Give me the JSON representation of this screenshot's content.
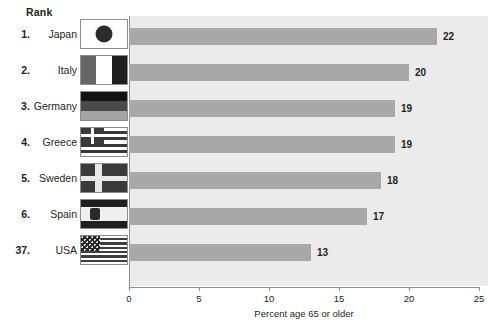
{
  "header": {
    "rank_label": "Rank"
  },
  "chart_data": {
    "type": "bar",
    "orientation": "horizontal",
    "title": "",
    "xlabel": "Percent age 65 or older",
    "ylabel": "",
    "xlim": [
      0,
      25
    ],
    "xticks": [
      0,
      5,
      10,
      15,
      20,
      25
    ],
    "xtick_labels": [
      "0",
      "5",
      "10",
      "15",
      "20",
      "25"
    ],
    "grid": false,
    "legend": null,
    "categories": [
      "Japan",
      "Italy",
      "Germany",
      "Greece",
      "Sweden",
      "Spain",
      "USA"
    ],
    "values": [
      22,
      20,
      19,
      19,
      18,
      17,
      13
    ],
    "data_labels": [
      "22",
      "20",
      "19",
      "19",
      "18",
      "17",
      "13"
    ],
    "ranks": [
      "1.",
      "2.",
      "3.",
      "4.",
      "5.",
      "6.",
      "37."
    ],
    "rows": [
      {
        "rank": "1.",
        "country": "Japan",
        "value": 22,
        "label": "22",
        "flag": "flag-japan"
      },
      {
        "rank": "2.",
        "country": "Italy",
        "value": 20,
        "label": "20",
        "flag": "flag-italy"
      },
      {
        "rank": "3.",
        "country": "Germany",
        "value": 19,
        "label": "19",
        "flag": "flag-germany"
      },
      {
        "rank": "4.",
        "country": "Greece",
        "value": 19,
        "label": "19",
        "flag": "flag-greece"
      },
      {
        "rank": "5.",
        "country": "Sweden",
        "value": 18,
        "label": "18",
        "flag": "flag-sweden"
      },
      {
        "rank": "6.",
        "country": "Spain",
        "value": 17,
        "label": "17",
        "flag": "flag-spain"
      },
      {
        "rank": "37.",
        "country": "USA",
        "value": 13,
        "label": "13",
        "flag": "flag-usa"
      }
    ],
    "colors": {
      "bar": "#a8a8a8",
      "plot_background": "#ebebeb",
      "axis": "#8f8f8f",
      "text": "#231f20",
      "page_background": "#ffffff"
    }
  }
}
